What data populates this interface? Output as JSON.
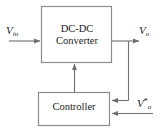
{
  "diagram": {
    "type": "block-diagram",
    "width": 163,
    "height": 129,
    "background_color": "#ffffff",
    "line_color": "#808080",
    "text_color": "#1b1b1b"
  },
  "blocks": [
    {
      "id": "converter",
      "label_line1": "DC-DC",
      "label_line2": "Converter",
      "x": 41,
      "y": 6,
      "w": 71,
      "h": 57
    },
    {
      "id": "controller",
      "label": "Controller",
      "x": 38,
      "y": 92,
      "w": 72,
      "h": 34
    }
  ],
  "signals": {
    "input": {
      "symbol": "V",
      "subscript": "in",
      "superscript": ""
    },
    "output": {
      "symbol": "V",
      "subscript": "o",
      "superscript": ""
    },
    "reference": {
      "symbol": "V",
      "subscript": "o",
      "superscript": "*"
    }
  },
  "connections": [
    {
      "name": "vin-to-converter",
      "from": "V_in source",
      "to": "converter left input",
      "direction": "right"
    },
    {
      "name": "converter-to-vo",
      "from": "converter right output",
      "to": "V_o node",
      "direction": "right"
    },
    {
      "name": "vo-feedback-to-controller",
      "from": "V_o node",
      "to": "controller right input (upper)",
      "direction": "left"
    },
    {
      "name": "voref-to-controller",
      "from": "V_o* reference",
      "to": "controller right input (lower)",
      "direction": "left"
    },
    {
      "name": "controller-to-converter",
      "from": "controller top output",
      "to": "converter bottom input",
      "direction": "up"
    }
  ]
}
